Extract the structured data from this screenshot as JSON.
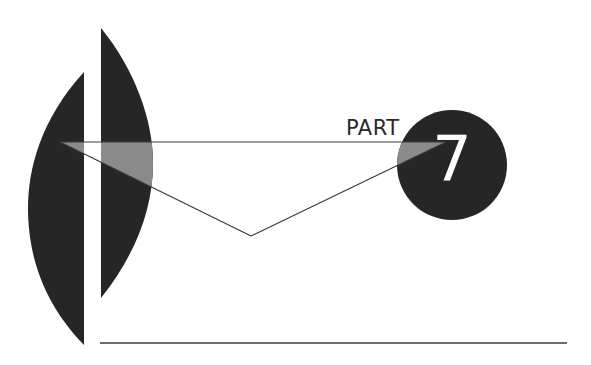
{
  "title": {
    "label": "PART",
    "number": "7"
  },
  "colors": {
    "background": "#ffffff",
    "dark_shape": "#262626",
    "overlap_gray": "#8a8a8a",
    "line": "#3a3a3a",
    "number_text": "#ffffff"
  }
}
